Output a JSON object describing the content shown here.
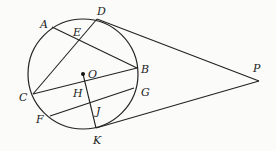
{
  "diagram": {
    "type": "geometry",
    "circle": {
      "center_label": "O",
      "cx": 83,
      "cy": 74,
      "r": 55
    },
    "points": {
      "A": {
        "x": 52,
        "y": 27,
        "lx": 40,
        "ly": 28
      },
      "D": {
        "x": 97,
        "y": 19,
        "lx": 97,
        "ly": 15
      },
      "E": {
        "x": 79,
        "y": 41,
        "lx": 73,
        "ly": 36
      },
      "B": {
        "x": 137,
        "y": 68,
        "lx": 141,
        "ly": 73
      },
      "C": {
        "x": 33,
        "y": 94,
        "lx": 19,
        "ly": 101
      },
      "O": {
        "x": 83,
        "y": 74,
        "lx": 88,
        "ly": 78
      },
      "H": {
        "x": 86,
        "y": 87,
        "lx": 73,
        "ly": 97
      },
      "G": {
        "x": 134,
        "y": 88,
        "lx": 141,
        "ly": 96
      },
      "F": {
        "x": 50,
        "y": 116,
        "lx": 36,
        "ly": 123
      },
      "J": {
        "x": 91,
        "y": 103,
        "lx": 96,
        "ly": 115
      },
      "K": {
        "x": 96,
        "y": 128,
        "lx": 93,
        "ly": 144
      },
      "P": {
        "x": 259,
        "y": 81,
        "lx": 253,
        "ly": 72
      }
    },
    "segments": [
      [
        "A",
        "B"
      ],
      [
        "C",
        "D"
      ],
      [
        "C",
        "B"
      ],
      [
        "F",
        "G"
      ],
      [
        "O",
        "K"
      ],
      [
        "D",
        "P"
      ],
      [
        "K",
        "P"
      ]
    ]
  }
}
